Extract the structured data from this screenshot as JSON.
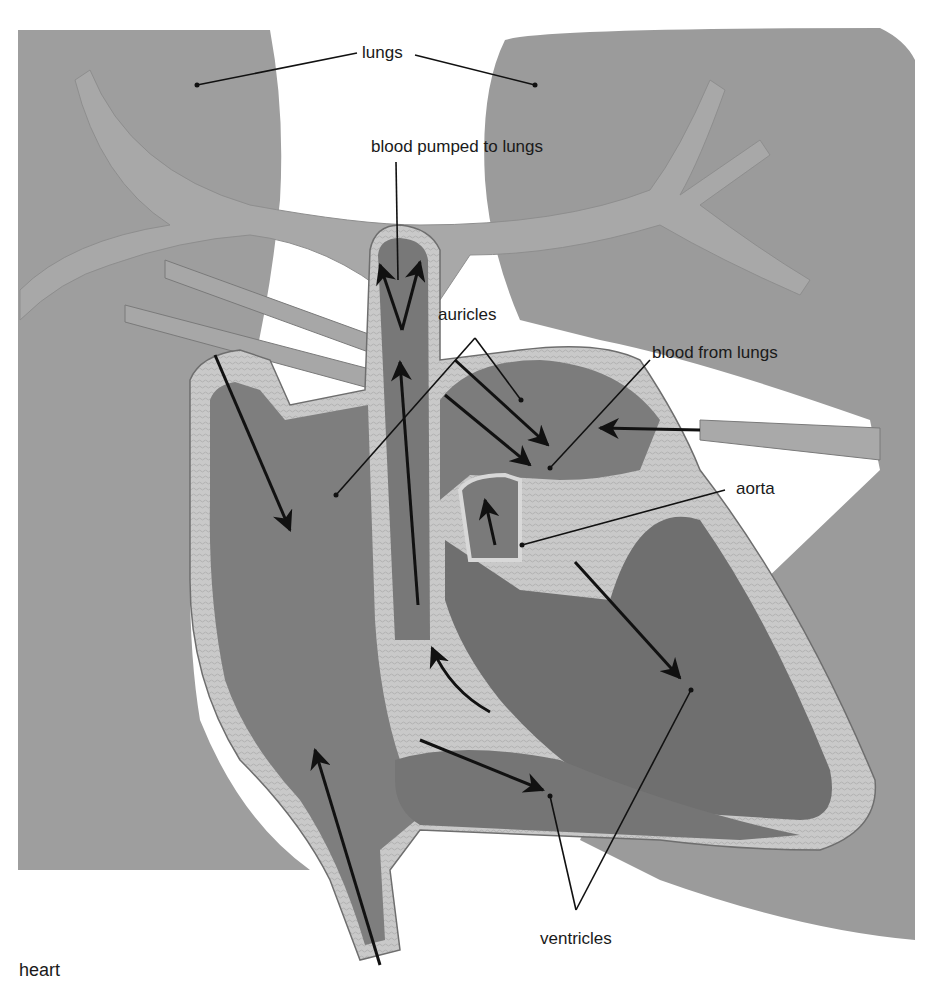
{
  "figure": {
    "caption": "heart",
    "colors": {
      "background": "#ffffff",
      "lung": "#9d9d9d",
      "lung_dark": "#8a8a8a",
      "vessel": "#a6a6a6",
      "chamber": "#7f7f7f",
      "chamber_dark": "#6e6e6e",
      "wall": "#c8c8c8",
      "ink": "#111111"
    }
  },
  "labels": {
    "lungs": "lungs",
    "blood_pumped_to_lungs": "blood pumped to lungs",
    "auricles": "auricles",
    "blood_from_lungs": "blood from lungs",
    "aorta": "aorta",
    "ventricles": "ventricles"
  }
}
